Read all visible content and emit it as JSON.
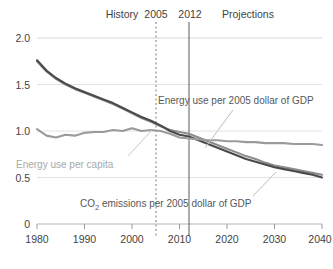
{
  "chart_data": {
    "type": "line",
    "title": "",
    "xlabel": "",
    "ylabel": "",
    "xlim": [
      1980,
      2040
    ],
    "ylim": [
      0,
      2.0
    ],
    "grid": true,
    "legend_position": "inline-annotations",
    "xticks": [
      "1980",
      "1990",
      "2000",
      "2010",
      "2020",
      "2030",
      "2040"
    ],
    "yticks": [
      "0",
      "0.5",
      "1.0",
      "1.5",
      "2.0"
    ],
    "annotations": {
      "history": "History",
      "marker_2005": "2005",
      "marker_2012": "2012",
      "projections": "Projections",
      "series_energy_gdp": "Energy use per 2005 dollar of GDP",
      "series_energy_capita": "Energy use per capita",
      "series_co2_gdp_prefix": "CO",
      "series_co2_gdp_sub": "2",
      "series_co2_gdp_suffix": " emissions per 2005 dollar of GDP"
    },
    "vertical_markers": [
      {
        "year": 2005,
        "style": "dashed",
        "label": "2005"
      },
      {
        "year": 2012,
        "style": "solid",
        "label": "2012"
      }
    ],
    "x": [
      1980,
      1982,
      1984,
      1986,
      1988,
      1990,
      1992,
      1994,
      1996,
      1998,
      2000,
      2002,
      2004,
      2006,
      2008,
      2010,
      2012,
      2014,
      2016,
      2018,
      2020,
      2022,
      2024,
      2026,
      2028,
      2030,
      2032,
      2034,
      2036,
      2038,
      2040
    ],
    "series": [
      {
        "name": "Energy use per 2005 dollar of GDP",
        "color": "#8c8c8c",
        "values": [
          1.75,
          1.64,
          1.56,
          1.5,
          1.45,
          1.41,
          1.37,
          1.33,
          1.29,
          1.24,
          1.19,
          1.14,
          1.1,
          1.05,
          1.01,
          0.99,
          0.97,
          0.93,
          0.89,
          0.85,
          0.81,
          0.77,
          0.73,
          0.7,
          0.66,
          0.63,
          0.61,
          0.59,
          0.57,
          0.55,
          0.53
        ]
      },
      {
        "name": "CO2 emissions per 2005 dollar of GDP",
        "color": "#4a4a4a",
        "values": [
          1.76,
          1.65,
          1.57,
          1.51,
          1.46,
          1.42,
          1.38,
          1.34,
          1.3,
          1.25,
          1.2,
          1.15,
          1.11,
          1.06,
          1.0,
          0.96,
          0.94,
          0.9,
          0.86,
          0.82,
          0.78,
          0.74,
          0.7,
          0.67,
          0.64,
          0.61,
          0.59,
          0.57,
          0.55,
          0.53,
          0.5
        ]
      },
      {
        "name": "Energy use per capita",
        "color": "#9a9a9a",
        "values": [
          1.02,
          0.95,
          0.93,
          0.96,
          0.95,
          0.98,
          0.99,
          0.99,
          1.01,
          1.0,
          1.03,
          1.0,
          1.01,
          1.0,
          0.97,
          0.93,
          0.92,
          0.91,
          0.9,
          0.9,
          0.89,
          0.89,
          0.88,
          0.88,
          0.87,
          0.87,
          0.87,
          0.86,
          0.86,
          0.86,
          0.85
        ]
      }
    ]
  }
}
